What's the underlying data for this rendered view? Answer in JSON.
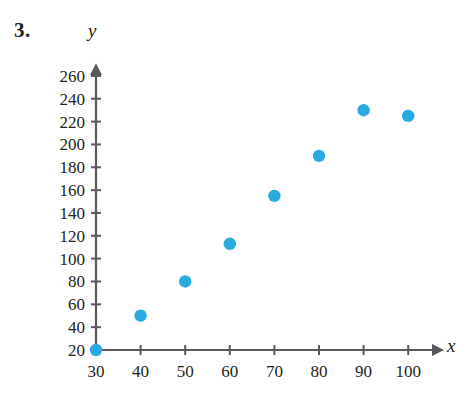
{
  "problem": {
    "number": "3."
  },
  "chart_data": {
    "type": "scatter",
    "title": "",
    "xlabel": "x",
    "ylabel": "y",
    "x": [
      30,
      40,
      50,
      60,
      70,
      80,
      90,
      100
    ],
    "values": [
      20,
      50,
      80,
      113,
      155,
      190,
      230,
      225
    ],
    "points": [
      {
        "x": 30,
        "y": 20
      },
      {
        "x": 40,
        "y": 50
      },
      {
        "x": 50,
        "y": 80
      },
      {
        "x": 60,
        "y": 113
      },
      {
        "x": 70,
        "y": 155
      },
      {
        "x": 80,
        "y": 190
      },
      {
        "x": 90,
        "y": 230
      },
      {
        "x": 100,
        "y": 225
      }
    ],
    "xticks": [
      30,
      40,
      50,
      60,
      70,
      80,
      90,
      100
    ],
    "xtick_labels": [
      "30",
      "40",
      "50",
      "60",
      "70",
      "80",
      "90",
      "100"
    ],
    "yticks": [
      20,
      40,
      60,
      80,
      100,
      120,
      140,
      160,
      180,
      200,
      220,
      240,
      260
    ],
    "ytick_labels": [
      "20",
      "40",
      "60",
      "80",
      "100",
      "120",
      "140",
      "160",
      "180",
      "200",
      "220",
      "240",
      "260"
    ],
    "xlim": [
      30,
      105
    ],
    "ylim": [
      20,
      268
    ],
    "grid": false,
    "legend": null,
    "marker_color": "#29abe2",
    "axis_color": "#58595b"
  }
}
